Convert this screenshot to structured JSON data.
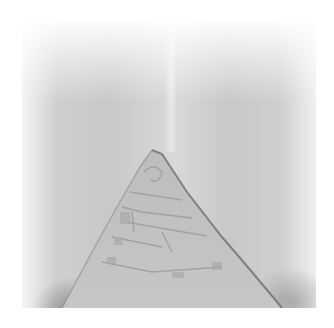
{
  "image": {
    "description": "Grayscale microscopy-style photograph of a tissue fold with a triangular exposed region showing cellular texture at the center-bottom",
    "palette": {
      "background": "#ffffff",
      "tissue_light": "#d9d9d9",
      "tissue_mid": "#c8c8c8",
      "edge_dark": "#6e6e6e"
    }
  }
}
